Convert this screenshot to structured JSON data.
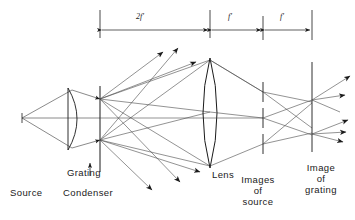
{
  "figure": {
    "background_color": "#ffffff",
    "ink_color": "#1a1a1a",
    "ray_color": "#555555",
    "width": 355,
    "height": 220
  },
  "dimensions": [
    {
      "id": "dim-2f",
      "label": "2f'",
      "x_start": 100,
      "x_end": 210,
      "y": 30,
      "text_x": 140,
      "text_y": 14
    },
    {
      "id": "dim-f1",
      "label": "f'",
      "x_start": 210,
      "x_end": 263,
      "y": 30,
      "text_x": 230,
      "text_y": 14
    },
    {
      "id": "dim-f2",
      "label": "f'",
      "x_start": 263,
      "x_end": 312,
      "y": 30,
      "text_x": 282,
      "text_y": 14
    }
  ],
  "labels": {
    "source": "Source",
    "grating": "Grating",
    "condenser": "Condenser",
    "lens": "Lens",
    "images_of_source_line1": "Images",
    "images_of_source_line2": "of",
    "images_of_source_line3": "source",
    "image_of_grating_line1": "Image",
    "image_of_grating_line2": "of",
    "image_of_grating_line3": "grating"
  },
  "components": {
    "source_point": {
      "x": 22,
      "y": 118
    },
    "condenser": {
      "x": 72,
      "y_top": 88,
      "y_bottom": 150,
      "type": "plano-convex"
    },
    "grating_plane": {
      "x": 100,
      "y_top": 88,
      "y_bottom": 172
    },
    "lens": {
      "x": 210,
      "y_top": 58,
      "y_bottom": 168,
      "type": "biconvex"
    },
    "image_planes_of_source": [
      {
        "x": 263,
        "y": 92
      },
      {
        "x": 263,
        "y": 118
      },
      {
        "x": 263,
        "y": 144
      }
    ],
    "image_of_grating_plane": {
      "x": 312,
      "y_top": 62,
      "y_bottom": 152
    }
  }
}
